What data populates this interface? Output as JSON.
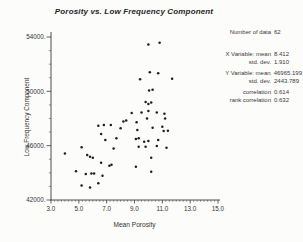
{
  "title": "Porosity vs. Low Frequency Component",
  "colors": {
    "background": "#fcfcfa",
    "ink": "#333333",
    "axis": "#3a3a3a",
    "point": "#1f1f1f"
  },
  "stats": {
    "rows": [
      {
        "label": "Number of data",
        "value": "62",
        "gap": "none"
      },
      {
        "label": "X Variable: mean",
        "value": "8.412",
        "gap": "lg"
      },
      {
        "label": "std. dev.",
        "value": "1.910",
        "gap": "none"
      },
      {
        "label": "Y Variable: mean",
        "value": "46965.199",
        "gap": "sm"
      },
      {
        "label": "std. dev.",
        "value": "2443.789",
        "gap": "none"
      },
      {
        "label": "correlation",
        "value": "0.614",
        "gap": "sm"
      },
      {
        "label": "rank correlation",
        "value": "0.632",
        "gap": "none"
      }
    ]
  },
  "chart_data": {
    "type": "scatter",
    "title": "Porosity vs. Low Frequency Component",
    "xlabel": "Mean Porosity",
    "ylabel": "Low Frequency Component",
    "xlim": [
      3.0,
      15.0
    ],
    "ylim": [
      42000,
      54000
    ],
    "x_ticks": [
      3.0,
      5.0,
      7.0,
      9.0,
      11.0,
      13.0,
      15.0
    ],
    "x_tick_labels": [
      "3.0",
      "5.0",
      "7.0",
      "9.0",
      "11.0",
      "13.0",
      "15.0"
    ],
    "y_ticks": [
      42000,
      46000,
      50000,
      54000
    ],
    "y_tick_labels": [
      "42000.",
      "46000.",
      "50000.",
      "54000."
    ],
    "x_minor_step": 0.25,
    "y_minor_step": 1000,
    "grid": false,
    "legend": "none",
    "n_points": 62,
    "points": [
      [
        10.0,
        53450
      ],
      [
        10.8,
        53580
      ],
      [
        10.1,
        51400
      ],
      [
        10.7,
        51330
      ],
      [
        9.4,
        50890
      ],
      [
        11.7,
        50930
      ],
      [
        10.05,
        50060
      ],
      [
        10.3,
        50120
      ],
      [
        9.8,
        49210
      ],
      [
        10.0,
        49070
      ],
      [
        10.2,
        49180
      ],
      [
        8.8,
        48400
      ],
      [
        9.5,
        48450
      ],
      [
        10.0,
        48550
      ],
      [
        10.6,
        48450
      ],
      [
        11.15,
        48350
      ],
      [
        11.2,
        48010
      ],
      [
        9.9,
        48010
      ],
      [
        6.4,
        47470
      ],
      [
        7.3,
        47520
      ],
      [
        6.8,
        47520
      ],
      [
        8.0,
        47280
      ],
      [
        9.15,
        47720
      ],
      [
        8.2,
        47790
      ],
      [
        8.4,
        47850
      ],
      [
        9.2,
        47150
      ],
      [
        10.3,
        47320
      ],
      [
        11.0,
        47400
      ],
      [
        11.1,
        47080
      ],
      [
        11.4,
        47100
      ],
      [
        6.6,
        46860
      ],
      [
        6.9,
        46420
      ],
      [
        7.7,
        46540
      ],
      [
        9.1,
        46490
      ],
      [
        9.3,
        46540
      ],
      [
        9.7,
        46290
      ],
      [
        10.0,
        46340
      ],
      [
        10.7,
        46420
      ],
      [
        5.2,
        45880
      ],
      [
        7.5,
        45800
      ],
      [
        9.3,
        45920
      ],
      [
        9.8,
        45920
      ],
      [
        10.6,
        45970
      ],
      [
        11.3,
        45850
      ],
      [
        4.0,
        45430
      ],
      [
        5.6,
        45310
      ],
      [
        5.8,
        45190
      ],
      [
        6.0,
        45110
      ],
      [
        10.2,
        45110
      ],
      [
        6.6,
        44740
      ],
      [
        7.2,
        44520
      ],
      [
        7.35,
        44600
      ],
      [
        9.1,
        44450
      ],
      [
        4.8,
        44110
      ],
      [
        5.5,
        43920
      ],
      [
        5.9,
        43940
      ],
      [
        6.1,
        43940
      ],
      [
        6.7,
        43780
      ],
      [
        10.2,
        44080
      ],
      [
        5.2,
        43060
      ],
      [
        5.8,
        42910
      ],
      [
        6.4,
        43230
      ]
    ]
  }
}
